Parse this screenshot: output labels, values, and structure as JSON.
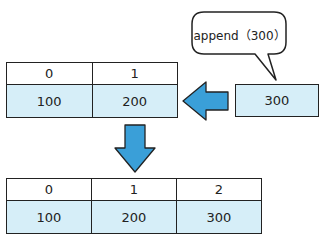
{
  "speech_bubble": {
    "text": "append（300）"
  },
  "before_array": {
    "indices": [
      "0",
      "1"
    ],
    "values": [
      "100",
      "200"
    ]
  },
  "new_element": {
    "value": "300"
  },
  "after_array": {
    "indices": [
      "0",
      "1",
      "2"
    ],
    "values": [
      "100",
      "200",
      "300"
    ]
  },
  "colors": {
    "cell_fill": "#d6eef8",
    "arrow_fill": "#3a9fd8",
    "outline": "#222222"
  },
  "icons": {
    "left_arrow": "left-arrow-icon",
    "down_arrow": "down-arrow-icon"
  }
}
